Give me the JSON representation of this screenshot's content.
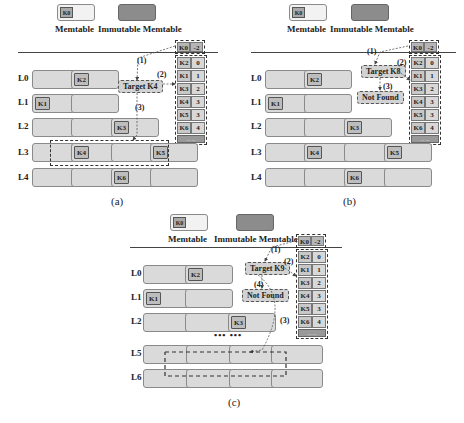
{
  "legend": {
    "memtable_label": "Memtable",
    "memtable_key": "K0",
    "immutable_label": "Immutable Memtable"
  },
  "levels": [
    "L0",
    "L1",
    "L2",
    "L3",
    "L4",
    "L5",
    "L6"
  ],
  "table": {
    "header": {
      "key": "K0",
      "value": "-2"
    },
    "rows": [
      {
        "key": "K2",
        "value": "0"
      },
      {
        "key": "K1",
        "value": "1"
      },
      {
        "key": "K3",
        "value": "2"
      },
      {
        "key": "K4",
        "value": "3"
      },
      {
        "key": "K5",
        "value": "3"
      },
      {
        "key": "K6",
        "value": "4"
      }
    ],
    "footer": "... ..."
  },
  "panels": {
    "a": {
      "caption": "(a)",
      "target": "Target K4",
      "steps": [
        "(1)",
        "(2)",
        "(3)"
      ],
      "sst_keys": {
        "L0": "K2",
        "L1": "K1",
        "L2": "K3",
        "L3a": "K4",
        "L3b": "K5",
        "L4": "K6"
      }
    },
    "b": {
      "caption": "(b)",
      "target": "Target K8",
      "not_found": "Not Found",
      "steps": [
        "(1)",
        "(2)",
        "(3)"
      ],
      "sst_keys": {
        "L0": "K2",
        "L1": "K1",
        "L2": "K3",
        "L3a": "K4",
        "L3b": "K5",
        "L4": "K6"
      }
    },
    "c": {
      "caption": "(c)",
      "target": "Target K9",
      "not_found": "Not Found",
      "steps": [
        "(1)",
        "(2)",
        "(3)",
        "(4)"
      ],
      "ellipsis": "•••  •••",
      "sst_keys": {
        "L0": "K2",
        "L1": "K1",
        "L2": "K3"
      }
    }
  },
  "colors": {
    "sst_fill": "#dadada",
    "key_fill": "#bdbdbd",
    "immutable_fill": "#8c8c8c",
    "table_fill": "#c8c8c8"
  }
}
